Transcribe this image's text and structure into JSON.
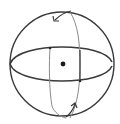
{
  "figure": {
    "description": "Hand-drawn sphere with equator and meridian, rotation arrows and a center point",
    "icon": "sphere-rotation-icon",
    "stroke_color": "#3a3a3a",
    "light_stroke_color": "#8a8a8a",
    "background": "#ffffff",
    "parts": {
      "outer_circle": "sphere-outline",
      "equator": "equator-ellipse",
      "meridian": "meridian-ellipse",
      "center": "center-dot",
      "arrow_top": "rotation-arrow-top",
      "arrow_bottom": "rotation-arrow-bottom"
    }
  }
}
